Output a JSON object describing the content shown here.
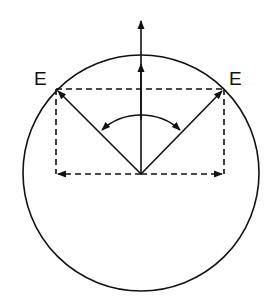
{
  "diagram": {
    "type": "vector-diagram",
    "labels": {
      "left_vector": "E",
      "right_vector": "E"
    },
    "colors": {
      "stroke": "#111111",
      "background": "#ffffff"
    },
    "elements": [
      "circle",
      "vertical-arrow",
      "left-diagonal-vector-E",
      "right-diagonal-vector-E",
      "dashed-rectangle-components",
      "horizontal-component-arrows",
      "angle-arc-double-arrow"
    ]
  }
}
